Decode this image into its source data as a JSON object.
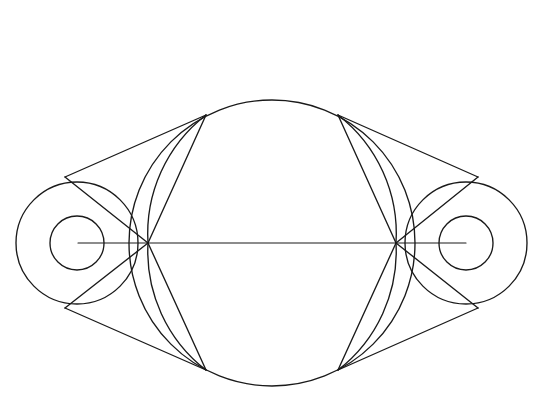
{
  "figure": {
    "background_color": "#ffffff",
    "stroke_color": "#1a1a1a",
    "stroke_width": 1.35,
    "width": 541,
    "height": 413,
    "caption": ""
  },
  "chart_data": {
    "type": "diagram",
    "xlabel": "",
    "ylabel": "",
    "xlim": [
      0,
      541
    ],
    "ylim": [
      0,
      413
    ],
    "grid": false,
    "legend": "none",
    "axis_line_y": 243,
    "circles": [
      {
        "name": "left-pulley-outer-circle",
        "cx": 77,
        "cy": 243,
        "r": 61
      },
      {
        "name": "left-pulley-inner-circle",
        "cx": 77,
        "cy": 243,
        "r": 27
      },
      {
        "name": "right-pulley-outer-circle",
        "cx": 466,
        "cy": 243,
        "r": 61
      },
      {
        "name": "right-pulley-inner-circle",
        "cx": 466,
        "cy": 243,
        "r": 27
      },
      {
        "name": "central-large-circle",
        "cx": 272,
        "cy": 243,
        "r": 143
      }
    ],
    "nodes": [
      {
        "name": "left-convergence-node",
        "x": 148,
        "y": 243
      },
      {
        "name": "right-convergence-node",
        "x": 396,
        "y": 243
      },
      {
        "name": "left-circle-upper-tangent",
        "x": 65,
        "y": 177
      },
      {
        "name": "left-circle-lower-tangent",
        "x": 65,
        "y": 308
      },
      {
        "name": "right-circle-upper-tangent",
        "x": 478,
        "y": 177
      },
      {
        "name": "right-circle-lower-tangent",
        "x": 478,
        "y": 308
      },
      {
        "name": "central-upper-left-tangent",
        "x": 206,
        "y": 115
      },
      {
        "name": "central-lower-left-tangent",
        "x": 206,
        "y": 370
      },
      {
        "name": "central-upper-right-tangent",
        "x": 338,
        "y": 115
      },
      {
        "name": "central-lower-right-tangent",
        "x": 338,
        "y": 370
      }
    ],
    "lines": [
      {
        "name": "outer-belt-upper-left",
        "x1": 65,
        "y1": 177,
        "x2": 206,
        "y2": 115
      },
      {
        "name": "outer-belt-lower-left",
        "x1": 65,
        "y1": 308,
        "x2": 206,
        "y2": 370
      },
      {
        "name": "outer-belt-upper-right",
        "x1": 338,
        "y1": 115,
        "x2": 478,
        "y2": 177
      },
      {
        "name": "outer-belt-lower-right",
        "x1": 338,
        "y1": 370,
        "x2": 478,
        "y2": 308
      },
      {
        "name": "crossed-belt-upper-left",
        "x1": 148,
        "y1": 243,
        "x2": 206,
        "y2": 115
      },
      {
        "name": "crossed-belt-lower-left",
        "x1": 148,
        "y1": 243,
        "x2": 206,
        "y2": 370
      },
      {
        "name": "crossed-belt-upper-right",
        "x1": 396,
        "y1": 243,
        "x2": 338,
        "y2": 115
      },
      {
        "name": "crossed-belt-lower-right",
        "x1": 396,
        "y1": 243,
        "x2": 338,
        "y2": 370
      },
      {
        "name": "chord-left-upper-to-node",
        "x1": 65,
        "y1": 177,
        "x2": 148,
        "y2": 243
      },
      {
        "name": "chord-left-lower-to-node",
        "x1": 65,
        "y1": 308,
        "x2": 148,
        "y2": 243
      },
      {
        "name": "chord-right-upper-to-node",
        "x1": 478,
        "y1": 177,
        "x2": 396,
        "y2": 243
      },
      {
        "name": "chord-right-lower-to-node",
        "x1": 478,
        "y1": 308,
        "x2": 396,
        "y2": 243
      },
      {
        "name": "horizontal-centerline",
        "x1": 78,
        "y1": 243,
        "x2": 466,
        "y2": 243
      }
    ],
    "arcs": [
      {
        "name": "arc-upper-left-envelope",
        "x1": 206,
        "y1": 115,
        "x2": 148,
        "y2": 243,
        "rx": 150,
        "ry": 150,
        "sweep": 1
      },
      {
        "name": "arc-lower-left-envelope",
        "x1": 148,
        "y1": 243,
        "x2": 206,
        "y2": 370,
        "rx": 150,
        "ry": 150,
        "sweep": 1
      },
      {
        "name": "arc-upper-right-envelope",
        "x1": 338,
        "y1": 115,
        "x2": 396,
        "y2": 243,
        "rx": 150,
        "ry": 150,
        "sweep": 0
      },
      {
        "name": "arc-lower-right-envelope",
        "x1": 396,
        "y1": 243,
        "x2": 338,
        "y2": 370,
        "rx": 150,
        "ry": 150,
        "sweep": 0
      }
    ]
  }
}
